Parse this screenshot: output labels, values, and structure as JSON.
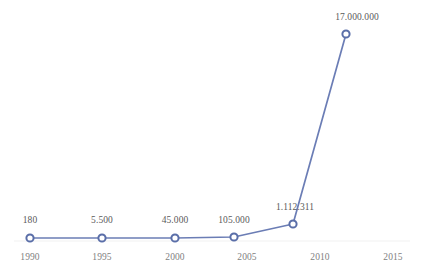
{
  "chart_data": {
    "type": "line",
    "title": "",
    "subtitle": "",
    "xlabel": "",
    "ylabel": "",
    "grid": false,
    "legend": "none",
    "xlim": [
      1988.0,
      2016.5
    ],
    "ylim": [
      0,
      17000000
    ],
    "x_ticks": [
      "1990",
      "1995",
      "2000",
      "2005",
      "2010",
      "2015"
    ],
    "x_tick_values": [
      1990,
      1995,
      2000,
      2005,
      2010,
      2015
    ],
    "series": [
      {
        "name": "Series 1",
        "color": "#6b7db5",
        "marker": "circle",
        "x": [
          1990,
          1995,
          2000,
          2004,
          2008,
          2012
        ],
        "values": [
          180,
          5500,
          45000,
          105000,
          1112311,
          17000000
        ],
        "point_labels": [
          "180",
          "5.500",
          "45.000",
          "105.000",
          "1.112.311",
          "17.000.000"
        ]
      }
    ]
  },
  "style": {
    "line_color": "#6b7db5",
    "marker_stroke": "#5a6ea8",
    "marker_fill": "#ffffff",
    "axis_color": "#f2f2f2",
    "tick_text_color": "#7f7f7f",
    "label_text_color": "#5a5a5a",
    "background": "#ffffff"
  },
  "geometry": {
    "points_px": [
      {
        "x": 30,
        "y": 238,
        "label_x": 30,
        "label_y": 215
      },
      {
        "x": 102,
        "y": 238,
        "label_x": 102,
        "label_y": 215
      },
      {
        "x": 175,
        "y": 238,
        "label_x": 175,
        "label_y": 215
      },
      {
        "x": 234,
        "y": 237,
        "label_x": 234,
        "label_y": 215
      },
      {
        "x": 293,
        "y": 224,
        "label_x": 295,
        "label_y": 202
      },
      {
        "x": 346,
        "y": 34,
        "label_x": 357,
        "label_y": 12
      }
    ],
    "tick_px": [
      {
        "x": 30,
        "y": 252
      },
      {
        "x": 102,
        "y": 252
      },
      {
        "x": 175,
        "y": 252
      },
      {
        "x": 247,
        "y": 252
      },
      {
        "x": 320,
        "y": 252
      },
      {
        "x": 393,
        "y": 252
      }
    ],
    "axis_line": {
      "x1": 14,
      "x2": 410,
      "y": 241
    }
  }
}
